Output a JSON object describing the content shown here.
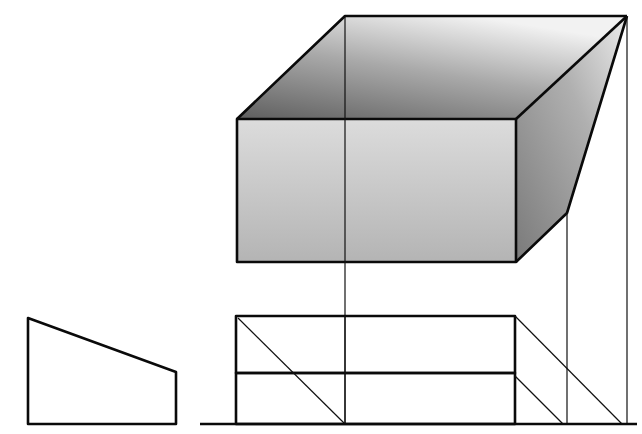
{
  "diagram": {
    "type": "technical-projection-drawing",
    "colors": {
      "background": "#ffffff",
      "stroke": "#111111",
      "face_light": "#d6d6d6",
      "face_mid": "#bdbdbd",
      "face_dark": "#6e6e6e"
    },
    "elements": {
      "profile_view": {
        "label": "Side profile trapezoid"
      },
      "oblique_box": {
        "label": "Oblique box with top, front, and sloped right faces"
      },
      "elevation_view": {
        "label": "Elevation with two stacked rectangles and diagonal construction lines"
      },
      "ground_line": {
        "label": "Ground line"
      },
      "projection_lines": {
        "label": "Vertical projection lines"
      }
    }
  }
}
